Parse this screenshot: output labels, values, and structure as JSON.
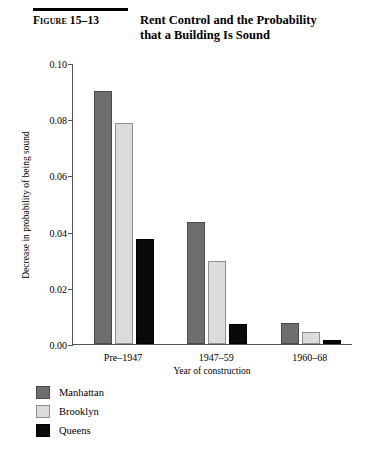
{
  "figure": {
    "number": "Figure 15–13",
    "title_line1": "Rent Control and the Probability",
    "title_line2": "that a Building Is Sound"
  },
  "chart_data": {
    "type": "bar",
    "title": "Rent Control and the Probability that a Building Is Sound",
    "xlabel": "Year of construction",
    "ylabel": "Decrease in probability of being sound",
    "categories": [
      "Pre–1947",
      "1947–59",
      "1960–68"
    ],
    "series": [
      {
        "name": "Manhattan",
        "color": "#6e6e6e",
        "values": [
          0.09,
          0.0435,
          0.0075
        ]
      },
      {
        "name": "Brooklyn",
        "color": "#dcdcdc",
        "values": [
          0.0785,
          0.0295,
          0.0042
        ]
      },
      {
        "name": "Queens",
        "color": "#0a0a0a",
        "values": [
          0.0375,
          0.0072,
          0.0015
        ]
      }
    ],
    "ylim": [
      0.0,
      0.1
    ],
    "yticks": [
      "0.00",
      "0.02",
      "0.04",
      "0.06",
      "0.08",
      "0.10"
    ],
    "ytick_values": [
      0.0,
      0.02,
      0.04,
      0.06,
      0.08,
      0.1
    ],
    "grid": false,
    "legend_position": "below-left"
  }
}
